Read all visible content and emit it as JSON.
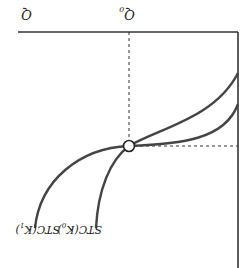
{
  "diagram": {
    "orientation_note": "rendered rotated 180 degrees",
    "axis_labels": {
      "x_axis": "Q",
      "x_marker": "Q",
      "x_marker_sub": "0"
    },
    "curves": [
      {
        "name": "STC(K",
        "sub": "0",
        "close": ")",
        "color": "#444444"
      },
      {
        "name": "STC(K",
        "sub": "1",
        "close": ")",
        "color": "#444444"
      }
    ],
    "tangency_point": {
      "label": ""
    },
    "colors": {
      "curve": "#444444",
      "axis": "#333333",
      "dashed": "#333333"
    }
  }
}
